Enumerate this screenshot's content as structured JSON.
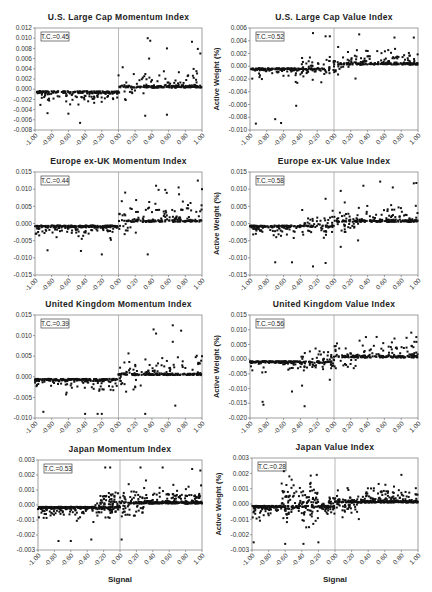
{
  "chart_data": [
    {
      "type": "scatter",
      "title": "U.S. Large Cap Momentum Index",
      "annotation": "T.C.=0.45",
      "xlabel": "",
      "ylabel": "",
      "xlim": [
        -1.0,
        1.0
      ],
      "ylim": [
        -0.008,
        0.012
      ],
      "yticks": [
        "0.012",
        "0.010",
        "0.008",
        "0.006",
        "0.004",
        "0.002",
        "0.000",
        "-0.002",
        "-0.004",
        "-0.006",
        "-0.008"
      ],
      "xticks": [
        "-1.00",
        "-0.80",
        "-0.60",
        "-0.40",
        "-0.20",
        "0.00",
        "0.20",
        "0.40",
        "0.60",
        "0.80",
        "1.00"
      ],
      "grid": false,
      "pattern": {
        "neg_band": [
          -0.0005,
          -0.001
        ],
        "neg_spread": 0.003,
        "pos_band": [
          0.0005,
          0.001
        ],
        "pos_spread": 0.006,
        "outliers": [
          [
            0.35,
            0.01
          ],
          [
            0.38,
            0.0095
          ],
          [
            0.58,
            0.008
          ],
          [
            0.88,
            0.0093
          ],
          [
            0.95,
            0.0079
          ],
          [
            0.98,
            0.007
          ],
          [
            0.05,
            0.0043
          ],
          [
            -0.46,
            -0.0066
          ],
          [
            -0.85,
            -0.0047
          ],
          [
            -0.6,
            -0.0048
          ],
          [
            0.32,
            -0.0052
          ],
          [
            0.58,
            -0.005
          ]
        ]
      }
    },
    {
      "type": "scatter",
      "title": "U.S. Large Cap Value Index",
      "annotation": "T.C.=0.52",
      "xlabel": "",
      "ylabel": "Active Weight (%)",
      "xlim": [
        -1.0,
        1.0
      ],
      "ylim": [
        -0.01,
        0.006
      ],
      "yticks": [
        "0.006",
        "0.004",
        "0.002",
        "0.000",
        "-0.002",
        "-0.004",
        "-0.006",
        "-0.008",
        "-0.010"
      ],
      "xticks": [
        "-1.00",
        "-0.80",
        "-0.60",
        "-0.40",
        "-0.20",
        "0.00",
        "0.20",
        "0.40",
        "0.60",
        "0.80",
        "1.00"
      ],
      "grid": false,
      "pattern": {
        "outliers": [
          [
            -0.25,
            0.0052
          ],
          [
            -0.1,
            0.0047
          ],
          [
            -0.05,
            0.0047
          ],
          [
            0.3,
            0.005
          ],
          [
            0.72,
            0.0045
          ],
          [
            0.95,
            0.0045
          ],
          [
            -0.93,
            -0.009
          ],
          [
            -0.63,
            -0.0089
          ],
          [
            -0.7,
            -0.0083
          ],
          [
            -0.45,
            -0.0062
          ]
        ]
      }
    },
    {
      "type": "scatter",
      "title": "Europe ex-UK Momentum Index",
      "annotation": "T.C.=0.44",
      "xlabel": "",
      "ylabel": "",
      "xlim": [
        -1.0,
        1.0
      ],
      "ylim": [
        -0.015,
        0.015
      ],
      "yticks": [
        "0.015",
        "0.010",
        "0.005",
        "0.000",
        "-0.005",
        "-0.010",
        "-0.015"
      ],
      "xticks": [
        "-1.00",
        "-0.80",
        "-0.60",
        "-0.40",
        "-0.20",
        "0.00",
        "0.20",
        "0.40",
        "0.60",
        "0.80",
        "1.00"
      ],
      "grid": false,
      "pattern": {
        "outliers": [
          [
            0.08,
            0.009
          ],
          [
            0.45,
            0.011
          ],
          [
            0.48,
            0.0098
          ],
          [
            0.56,
            0.0098
          ],
          [
            0.72,
            0.0105
          ],
          [
            0.95,
            0.0125
          ],
          [
            1.0,
            0.01
          ],
          [
            -0.2,
            -0.009
          ],
          [
            0.35,
            -0.009
          ],
          [
            -0.45,
            -0.008
          ],
          [
            -0.85,
            -0.0078
          ]
        ]
      }
    },
    {
      "type": "scatter",
      "title": "Europe ex-UK Value Index",
      "annotation": "T.C.=0.58",
      "xlabel": "",
      "ylabel": "Active Weight (%)",
      "xlim": [
        -1.0,
        1.0
      ],
      "ylim": [
        -0.015,
        0.015
      ],
      "yticks": [
        "0.015",
        "0.010",
        "0.005",
        "0.000",
        "-0.005",
        "-0.010",
        "-0.015"
      ],
      "xticks": [
        "-1.00",
        "-0.80",
        "-0.60",
        "-0.40",
        "-0.20",
        "0.00",
        "0.20",
        "0.40",
        "0.60",
        "0.80",
        "1.00"
      ],
      "grid": false,
      "pattern": {
        "outliers": [
          [
            -0.1,
            0.0072
          ],
          [
            0.08,
            0.0095
          ],
          [
            0.35,
            0.011
          ],
          [
            0.55,
            0.0122
          ],
          [
            0.7,
            0.0105
          ],
          [
            0.95,
            0.0117
          ],
          [
            0.98,
            0.0118
          ],
          [
            -0.25,
            -0.0125
          ],
          [
            -0.1,
            -0.0115
          ],
          [
            -0.7,
            -0.0113
          ],
          [
            -0.5,
            -0.0113
          ],
          [
            0.08,
            -0.0068
          ]
        ]
      }
    },
    {
      "type": "scatter",
      "title": "United Kingdom Momentum Index",
      "annotation": "T.C.=0.39",
      "xlabel": "",
      "ylabel": "",
      "xlim": [
        -1.0,
        1.0
      ],
      "ylim": [
        -0.01,
        0.015
      ],
      "yticks": [
        "0.015",
        "0.010",
        "0.005",
        "0.000",
        "-0.005",
        "-0.010"
      ],
      "xticks": [
        "-1.00",
        "-0.80",
        "-0.60",
        "-0.40",
        "-0.20",
        "0.00",
        "0.20",
        "0.40",
        "0.60",
        "0.80",
        "1.00"
      ],
      "grid": false,
      "pattern": {
        "outliers": [
          [
            0.42,
            0.0115
          ],
          [
            0.45,
            0.0105
          ],
          [
            0.65,
            0.0125
          ],
          [
            0.65,
            0.0085
          ],
          [
            0.75,
            0.0112
          ],
          [
            1.0,
            0.005
          ],
          [
            -0.9,
            -0.0085
          ],
          [
            -0.4,
            -0.009
          ],
          [
            -0.25,
            -0.009
          ],
          [
            -0.2,
            -0.009
          ],
          [
            0.32,
            -0.009
          ],
          [
            0.68,
            -0.007
          ]
        ]
      }
    },
    {
      "type": "scatter",
      "title": "United Kingdom Value Index",
      "annotation": "T.C.=0.56",
      "xlabel": "",
      "ylabel": "Active Weight (%)",
      "xlim": [
        -1.0,
        1.0
      ],
      "ylim": [
        -0.02,
        0.015
      ],
      "yticks": [
        "0.015",
        "0.010",
        "0.005",
        "0.000",
        "-0.005",
        "-0.010",
        "-0.015",
        "-0.020"
      ],
      "xticks": [
        "-1.00",
        "-0.80",
        "-0.60",
        "-0.40",
        "-0.20",
        "0.00",
        "0.20",
        "0.40",
        "0.60",
        "0.80",
        "1.00"
      ],
      "grid": false,
      "pattern": {
        "outliers": [
          [
            -0.85,
            -0.0145
          ],
          [
            -0.84,
            -0.0155
          ],
          [
            -0.35,
            -0.016
          ],
          [
            -0.5,
            -0.011
          ],
          [
            -0.38,
            -0.009
          ],
          [
            -0.05,
            -0.007
          ],
          [
            0.38,
            0.0075
          ],
          [
            0.72,
            0.007
          ],
          [
            0.92,
            0.009
          ],
          [
            0.98,
            0.0075
          ]
        ]
      }
    },
    {
      "type": "scatter",
      "title": "Japan Momentum Index",
      "annotation": "T.C.=0.53",
      "xlabel": "Signal",
      "ylabel": "",
      "xlim": [
        -1.0,
        1.0
      ],
      "ylim": [
        -0.003,
        0.003
      ],
      "yticks": [
        "0.003",
        "0.002",
        "0.001",
        "0.000",
        "-0.001",
        "-0.002",
        "-0.003"
      ],
      "xticks": [
        "-1.00",
        "-0.80",
        "-0.60",
        "-0.40",
        "-0.20",
        "0.00",
        "0.20",
        "0.40",
        "0.60",
        "0.80",
        "1.00"
      ],
      "grid": false,
      "pattern": {
        "outliers": [
          [
            -0.18,
            0.0025
          ],
          [
            -0.12,
            0.0025
          ],
          [
            0.25,
            0.0025
          ],
          [
            0.52,
            0.0025
          ],
          [
            0.88,
            0.0024
          ],
          [
            0.98,
            0.0023
          ],
          [
            -0.75,
            -0.0024
          ],
          [
            -0.6,
            -0.0024
          ],
          [
            -0.35,
            -0.0023
          ],
          [
            0.02,
            -0.0023
          ]
        ]
      }
    },
    {
      "type": "scatter",
      "title": "Japan Value Index",
      "annotation": "T.C.=0.28",
      "xlabel": "Signal",
      "ylabel": "Active Weight (%)",
      "xlim": [
        -1.0,
        1.0
      ],
      "ylim": [
        -0.003,
        0.003
      ],
      "yticks": [
        "0.003",
        "0.002",
        "0.001",
        "0.000",
        "-0.001",
        "-0.002",
        "-0.003"
      ],
      "xticks": [
        "-1.00",
        "-0.80",
        "-0.60",
        "-0.40",
        "-0.20",
        "0.00",
        "0.20",
        "0.40",
        "0.60",
        "0.80",
        "1.00"
      ],
      "grid": false,
      "pattern": {
        "outliers": [
          [
            -0.55,
            0.0018
          ],
          [
            -0.22,
            0.0019
          ],
          [
            0.8,
            0.0019
          ],
          [
            -0.98,
            -0.0025
          ],
          [
            -0.6,
            -0.0026
          ],
          [
            -0.38,
            -0.0026
          ],
          [
            -0.2,
            -0.0025
          ]
        ]
      }
    }
  ]
}
